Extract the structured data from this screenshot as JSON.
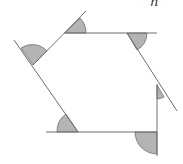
{
  "diagram": {
    "label": "n",
    "colors": {
      "line": "#6e6e6e",
      "shade": "#b4b4b4",
      "background": "#ffffff"
    },
    "vertices": [
      [
        65,
        33
      ],
      [
        127,
        33
      ],
      [
        157,
        85
      ],
      [
        157,
        132
      ],
      [
        78,
        132
      ],
      [
        33,
        65
      ]
    ],
    "exterior_angles_shaded": 6
  }
}
